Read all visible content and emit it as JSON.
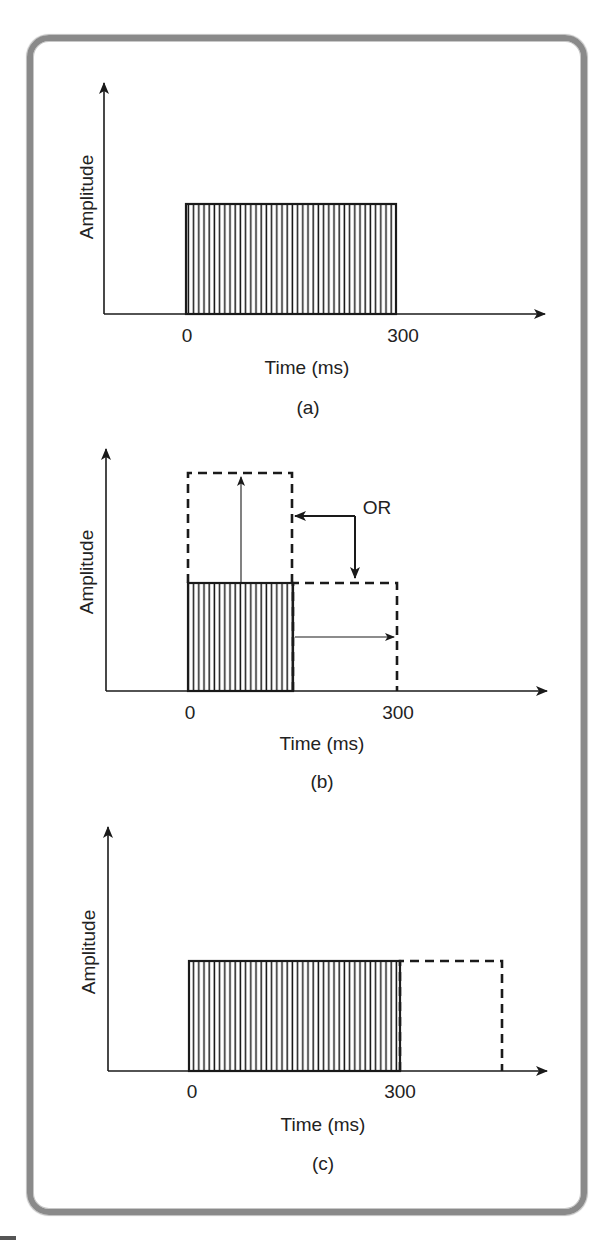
{
  "figure": {
    "frame": {
      "stroke": "#8a8a8a"
    },
    "colors": {
      "ink": "#1a1a1a",
      "hatch": "#1a1a1a",
      "background": "#ffffff"
    },
    "panels": [
      {
        "id": "a",
        "caption": "(a)",
        "ylabel": "Amplitude",
        "xlabel": "Time (ms)",
        "ticks": [
          {
            "label": "0",
            "x": 187
          },
          {
            "label": "300",
            "x": 403
          }
        ],
        "axes": {
          "origin_x": 104,
          "baseline_y": 314,
          "y_top": 83,
          "x_end": 545
        },
        "label_pos": {
          "ylabel_x": 88,
          "ylabel_y": 197,
          "tick_y": 342,
          "xlabel_x": 307,
          "xlabel_y": 374,
          "caption_x": 308,
          "caption_y": 414
        },
        "solid_bar": {
          "x0": 186,
          "x1": 396,
          "top": 204
        },
        "dashed_boxes": [],
        "arrows": [],
        "annotations": []
      },
      {
        "id": "b",
        "caption": "(b)",
        "ylabel": "Amplitude",
        "xlabel": "Time (ms)",
        "ticks": [
          {
            "label": "0",
            "x": 190
          },
          {
            "label": "300",
            "x": 398
          }
        ],
        "axes": {
          "origin_x": 106,
          "baseline_y": 691,
          "y_top": 449,
          "x_end": 547
        },
        "label_pos": {
          "ylabel_x": 88,
          "ylabel_y": 572,
          "tick_y": 719,
          "xlabel_x": 322,
          "xlabel_y": 750,
          "caption_x": 322,
          "caption_y": 788
        },
        "solid_bar": {
          "x0": 188,
          "x1": 293,
          "top": 583
        },
        "dashed_boxes": [
          {
            "name": "amplitude-doubled-box",
            "x0": 188,
            "x1": 292,
            "top": 473,
            "bottom": 583
          },
          {
            "name": "duration-doubled-box",
            "x0": 293,
            "x1": 397,
            "top": 583,
            "bottom": 691
          }
        ],
        "arrows": [
          {
            "name": "amplitude-increase-arrow",
            "x1": 241,
            "y1": 583,
            "x2": 241,
            "y2": 477,
            "thin": true
          },
          {
            "name": "duration-increase-arrow",
            "x1": 295,
            "y1": 637,
            "x2": 394,
            "y2": 637,
            "thin": true
          },
          {
            "name": "or-left-arrow",
            "x1": 355,
            "y1": 516,
            "x2": 295,
            "y2": 516,
            "thin": false
          },
          {
            "name": "or-down-arrow",
            "x1": 355,
            "y1": 516,
            "x2": 355,
            "y2": 578,
            "thin": false
          }
        ],
        "annotations": [
          {
            "name": "or-label",
            "text": "OR",
            "x": 377,
            "y": 514
          }
        ]
      },
      {
        "id": "c",
        "caption": "(c)",
        "ylabel": "Amplitude",
        "xlabel": "Time (ms)",
        "ticks": [
          {
            "label": "0",
            "x": 192
          },
          {
            "label": "300",
            "x": 400
          }
        ],
        "axes": {
          "origin_x": 108,
          "baseline_y": 1071,
          "y_top": 827,
          "x_end": 547
        },
        "label_pos": {
          "ylabel_x": 90,
          "ylabel_y": 952,
          "tick_y": 1098,
          "xlabel_x": 323,
          "xlabel_y": 1131,
          "caption_x": 323,
          "caption_y": 1170
        },
        "solid_bar": {
          "x0": 189,
          "x1": 400,
          "top": 961
        },
        "dashed_boxes": [
          {
            "name": "extended-duration-box",
            "x0": 400,
            "x1": 502,
            "top": 961,
            "bottom": 1071
          }
        ],
        "arrows": [],
        "annotations": []
      }
    ]
  },
  "chart_data": [
    {
      "type": "bar",
      "title": "(a)",
      "xlabel": "Time (ms)",
      "ylabel": "Amplitude",
      "x_ticks": [
        "0",
        "300"
      ],
      "series": [
        {
          "name": "stimulus",
          "style": "solid-hatched",
          "start_ms": 0,
          "end_ms": 300,
          "amplitude": 1.0
        }
      ]
    },
    {
      "type": "bar",
      "title": "(b)",
      "xlabel": "Time (ms)",
      "ylabel": "Amplitude",
      "x_ticks": [
        "0",
        "300"
      ],
      "series": [
        {
          "name": "stimulus",
          "style": "solid-hatched",
          "start_ms": 0,
          "end_ms": 150,
          "amplitude": 1.0
        },
        {
          "name": "increased amplitude",
          "style": "dashed",
          "start_ms": 0,
          "end_ms": 150,
          "amplitude": 2.0
        },
        {
          "name": "increased duration",
          "style": "dashed",
          "start_ms": 150,
          "end_ms": 300,
          "amplitude": 1.0
        }
      ],
      "annotations": [
        "OR"
      ]
    },
    {
      "type": "bar",
      "title": "(c)",
      "xlabel": "Time (ms)",
      "ylabel": "Amplitude",
      "x_ticks": [
        "0",
        "300"
      ],
      "series": [
        {
          "name": "stimulus",
          "style": "solid-hatched",
          "start_ms": 0,
          "end_ms": 300,
          "amplitude": 1.0
        },
        {
          "name": "extended duration",
          "style": "dashed",
          "start_ms": 300,
          "end_ms": 450,
          "amplitude": 1.0
        }
      ]
    }
  ]
}
